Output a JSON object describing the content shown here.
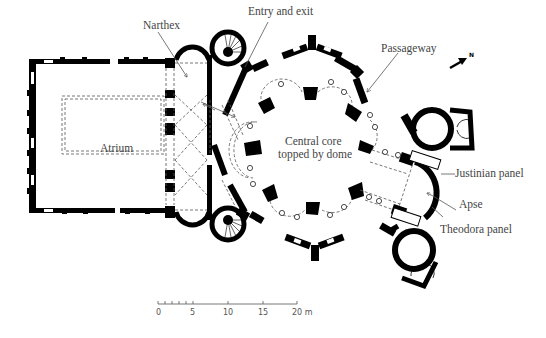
{
  "diagram": {
    "type": "architectural floor plan",
    "labels": {
      "narthex": "Narthex",
      "entry_exit": "Entry and exit",
      "passageway": "Passageway",
      "atrium": "Atrium",
      "central_core_line1": "Central core",
      "central_core_line2": "topped by dome",
      "justinian_panel": "Justinian panel",
      "apse": "Apse",
      "theodora_panel": "Theodora panel"
    },
    "north_arrow": {
      "label": "N"
    },
    "scale_bar": {
      "ticks": [
        "0",
        "5",
        "10",
        "15",
        "20 m"
      ],
      "unit": "m",
      "max": 20
    }
  },
  "colors": {
    "wall": "#000000",
    "text": "#444444",
    "line": "#555555",
    "background": "#ffffff"
  }
}
